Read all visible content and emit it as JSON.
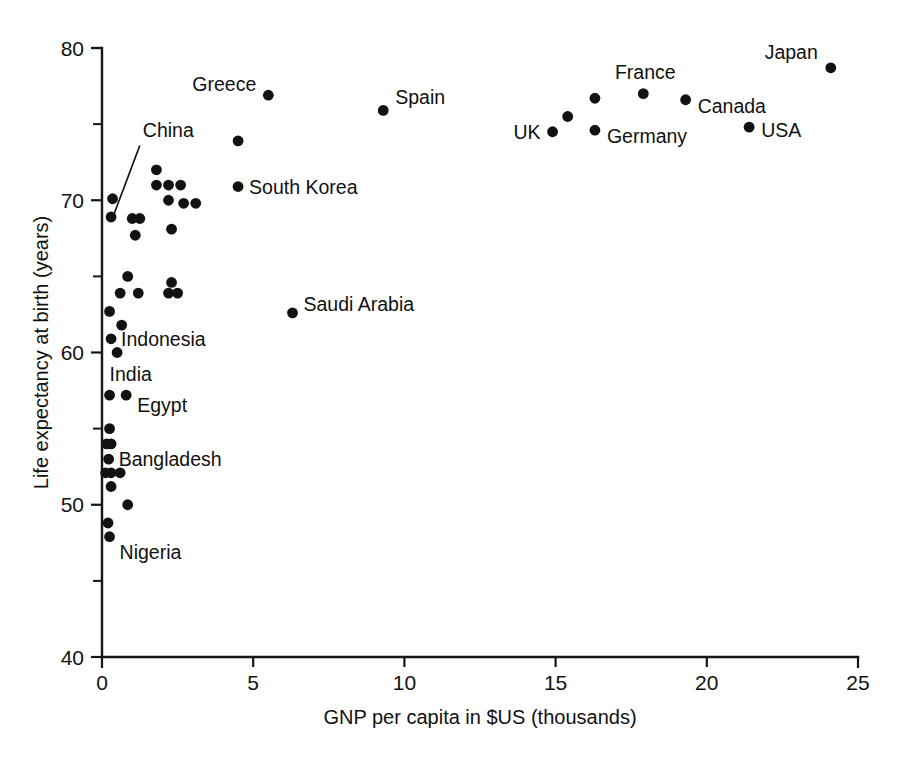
{
  "chart_data": {
    "type": "scatter",
    "title": "",
    "xlabel": "GNP per capita in $US (thousands)",
    "ylabel": "Life expectancy at birth (years)",
    "xlim": [
      0,
      25
    ],
    "ylim": [
      40,
      80
    ],
    "xticks": [
      0,
      5,
      10,
      15,
      20,
      25
    ],
    "xticklabels": [
      "0",
      "5",
      "10",
      "15",
      "20",
      "25"
    ],
    "yticks": [
      40,
      50,
      60,
      70,
      80
    ],
    "yticklabels": [
      "40",
      "50",
      "60",
      "70",
      "80"
    ],
    "y_minor_ticks": [
      45,
      55,
      65,
      75
    ],
    "grid": false,
    "legend": null,
    "marker": "filled-circle",
    "marker_color": "#121212",
    "points": [
      {
        "label": "Japan",
        "x": 24.1,
        "y": 78.7,
        "label_pos": "left"
      },
      {
        "label": "France",
        "x": 17.9,
        "y": 77.0,
        "label_pos": "above"
      },
      {
        "label": "Canada",
        "x": 19.3,
        "y": 76.6,
        "label_pos": "right"
      },
      {
        "label": "Germany",
        "x": 16.3,
        "y": 74.6,
        "label_pos": "right-below"
      },
      {
        "label": "UK",
        "x": 14.9,
        "y": 74.5,
        "label_pos": "left"
      },
      {
        "label": "USA",
        "x": 21.4,
        "y": 74.8,
        "label_pos": "right"
      },
      {
        "label": "Spain",
        "x": 9.3,
        "y": 75.9,
        "label_pos": "right"
      },
      {
        "label": "Greece",
        "x": 5.5,
        "y": 76.9,
        "label_pos": "left"
      },
      {
        "label": "South Korea",
        "x": 4.5,
        "y": 70.9,
        "label_pos": "right"
      },
      {
        "label": "Saudi Arabia",
        "x": 6.3,
        "y": 62.6,
        "label_pos": "right"
      },
      {
        "label": "China",
        "x": 0.3,
        "y": 68.9,
        "label_pos": "leader"
      },
      {
        "label": "Indonesia",
        "x": 0.3,
        "y": 60.9,
        "label_pos": "right"
      },
      {
        "label": "India",
        "x": 0.25,
        "y": 57.2,
        "label_pos": "above"
      },
      {
        "label": "Egypt",
        "x": 0.8,
        "y": 57.2,
        "label_pos": "right-below"
      },
      {
        "label": "Bangladesh",
        "x": 0.22,
        "y": 53.0,
        "label_pos": "right"
      },
      {
        "label": "Nigeria",
        "x": 0.25,
        "y": 47.9,
        "label_pos": "right-below"
      },
      {
        "label": "",
        "x": 16.3,
        "y": 76.7,
        "label_pos": ""
      },
      {
        "label": "",
        "x": 15.4,
        "y": 75.5,
        "label_pos": ""
      },
      {
        "label": "",
        "x": 4.5,
        "y": 73.9,
        "label_pos": ""
      },
      {
        "label": "",
        "x": 1.8,
        "y": 72.0,
        "label_pos": ""
      },
      {
        "label": "",
        "x": 1.8,
        "y": 71.0,
        "label_pos": ""
      },
      {
        "label": "",
        "x": 2.2,
        "y": 71.0,
        "label_pos": ""
      },
      {
        "label": "",
        "x": 2.6,
        "y": 71.0,
        "label_pos": ""
      },
      {
        "label": "",
        "x": 0.35,
        "y": 70.1,
        "label_pos": ""
      },
      {
        "label": "",
        "x": 2.2,
        "y": 70.0,
        "label_pos": ""
      },
      {
        "label": "",
        "x": 2.7,
        "y": 69.8,
        "label_pos": ""
      },
      {
        "label": "",
        "x": 3.1,
        "y": 69.8,
        "label_pos": ""
      },
      {
        "label": "",
        "x": 1.0,
        "y": 68.8,
        "label_pos": ""
      },
      {
        "label": "",
        "x": 1.25,
        "y": 68.8,
        "label_pos": ""
      },
      {
        "label": "",
        "x": 2.3,
        "y": 68.1,
        "label_pos": ""
      },
      {
        "label": "",
        "x": 1.1,
        "y": 67.7,
        "label_pos": ""
      },
      {
        "label": "",
        "x": 0.85,
        "y": 65.0,
        "label_pos": ""
      },
      {
        "label": "",
        "x": 2.3,
        "y": 64.6,
        "label_pos": ""
      },
      {
        "label": "",
        "x": 0.6,
        "y": 63.9,
        "label_pos": ""
      },
      {
        "label": "",
        "x": 1.2,
        "y": 63.9,
        "label_pos": ""
      },
      {
        "label": "",
        "x": 2.2,
        "y": 63.9,
        "label_pos": ""
      },
      {
        "label": "",
        "x": 2.5,
        "y": 63.9,
        "label_pos": ""
      },
      {
        "label": "",
        "x": 0.25,
        "y": 62.7,
        "label_pos": ""
      },
      {
        "label": "",
        "x": 0.65,
        "y": 61.8,
        "label_pos": ""
      },
      {
        "label": "",
        "x": 0.5,
        "y": 60.0,
        "label_pos": ""
      },
      {
        "label": "",
        "x": 0.25,
        "y": 55.0,
        "label_pos": ""
      },
      {
        "label": "",
        "x": 0.15,
        "y": 54.0,
        "label_pos": ""
      },
      {
        "label": "",
        "x": 0.3,
        "y": 54.0,
        "label_pos": ""
      },
      {
        "label": "",
        "x": 0.12,
        "y": 52.1,
        "label_pos": ""
      },
      {
        "label": "",
        "x": 0.3,
        "y": 52.1,
        "label_pos": ""
      },
      {
        "label": "",
        "x": 0.6,
        "y": 52.1,
        "label_pos": ""
      },
      {
        "label": "",
        "x": 0.3,
        "y": 51.2,
        "label_pos": ""
      },
      {
        "label": "",
        "x": 0.85,
        "y": 50.0,
        "label_pos": ""
      },
      {
        "label": "",
        "x": 0.2,
        "y": 48.8,
        "label_pos": ""
      }
    ],
    "annotations": [
      {
        "text": "China",
        "leader_from": {
          "x": 1.25,
          "y": 73.6
        },
        "leader_to": {
          "x": 0.3,
          "y": 68.9
        }
      }
    ]
  }
}
